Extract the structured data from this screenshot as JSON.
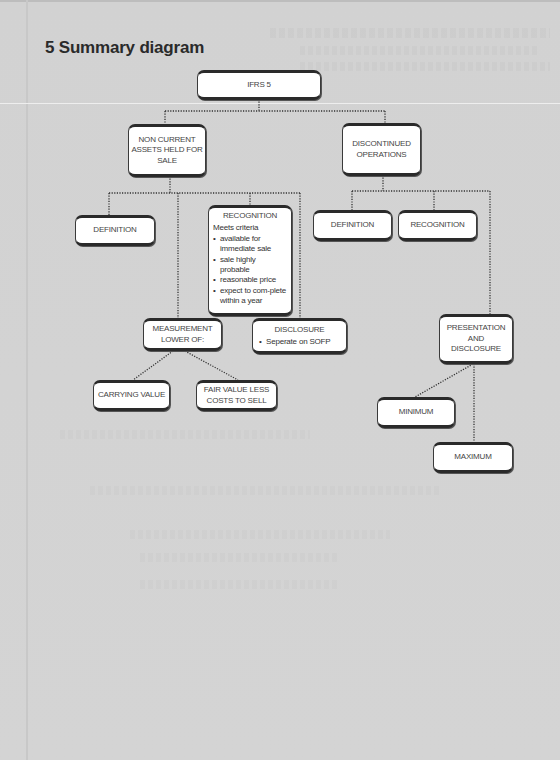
{
  "title": "5 Summary diagram",
  "diagram": {
    "root": {
      "label": "IFRS 5"
    },
    "left_branch": {
      "label_lines": [
        "NON CURRENT",
        "ASSETS HELD FOR",
        "SALE"
      ],
      "definition": {
        "label": "DEFINITION"
      },
      "recognition": {
        "label": "RECOGNITION",
        "subtitle": "Meets criteria",
        "items": [
          "available for immediate sale",
          "sale highly probable",
          "reasonable price",
          "expect to com-plete within a year"
        ]
      },
      "measurement": {
        "label_lines": [
          "MEASUREMENT",
          "LOWER OF:"
        ],
        "options": [
          {
            "label": "CARRYING VALUE"
          },
          {
            "label_lines": [
              "FAIR VALUE LESS",
              "COSTS TO SELL"
            ]
          }
        ]
      },
      "disclosure": {
        "label": "DISCLOSURE",
        "items": [
          "Seperate on SOFP"
        ]
      }
    },
    "right_branch": {
      "label_lines": [
        "DISCONTINUED",
        "OPERATIONS"
      ],
      "definition": {
        "label": "DEFINITION"
      },
      "recognition": {
        "label": "RECOGNITION"
      },
      "presentation": {
        "label_lines": [
          "PRESENTATION",
          "AND",
          "DISCLOSURE"
        ],
        "options": [
          {
            "label": "MINIMUM"
          },
          {
            "label": "MAXIMUM"
          }
        ]
      }
    }
  },
  "colors": {
    "background": "#d3d3d3",
    "node_fill": "#ffffff",
    "node_border": "#2a2a2a",
    "text": "#444444",
    "title": "#2a2a2a"
  }
}
